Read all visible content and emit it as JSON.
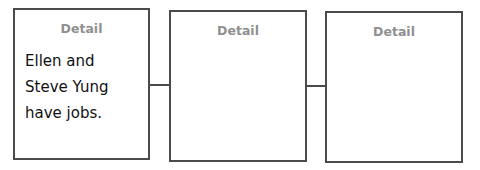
{
  "diagram": {
    "boxes": [
      {
        "label": "Detail",
        "text": "Ellen and Steve Yung have jobs."
      },
      {
        "label": "Detail",
        "text": ""
      },
      {
        "label": "Detail",
        "text": ""
      }
    ],
    "colors": {
      "border": "#4a4a4a",
      "label": "#8f8f8f",
      "text": "#111111"
    }
  }
}
